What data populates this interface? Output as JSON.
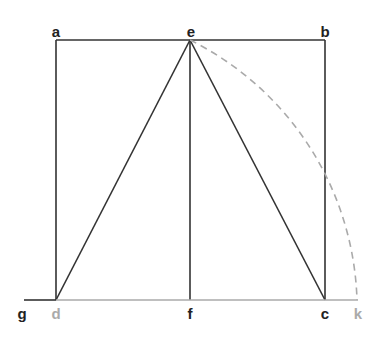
{
  "colors": {
    "line": "#333333",
    "gray": "#aaaaaa"
  },
  "labels": [
    {
      "id": "a",
      "text": "a",
      "x": 56,
      "y": 31,
      "color": "#222222"
    },
    {
      "id": "e",
      "text": "e",
      "x": 191,
      "y": 31,
      "color": "#222222"
    },
    {
      "id": "b",
      "text": "b",
      "x": 325,
      "y": 31,
      "color": "#222222"
    },
    {
      "id": "g",
      "text": "g",
      "x": 22,
      "y": 313,
      "color": "#222222"
    },
    {
      "id": "d",
      "text": "d",
      "x": 56,
      "y": 313,
      "color": "#aaaaaa"
    },
    {
      "id": "f",
      "text": "f",
      "x": 190,
      "y": 313,
      "color": "#222222"
    },
    {
      "id": "c",
      "text": "c",
      "x": 325,
      "y": 313,
      "color": "#222222"
    },
    {
      "id": "k",
      "text": "k",
      "x": 358,
      "y": 313,
      "color": "#aaaaaa"
    }
  ]
}
